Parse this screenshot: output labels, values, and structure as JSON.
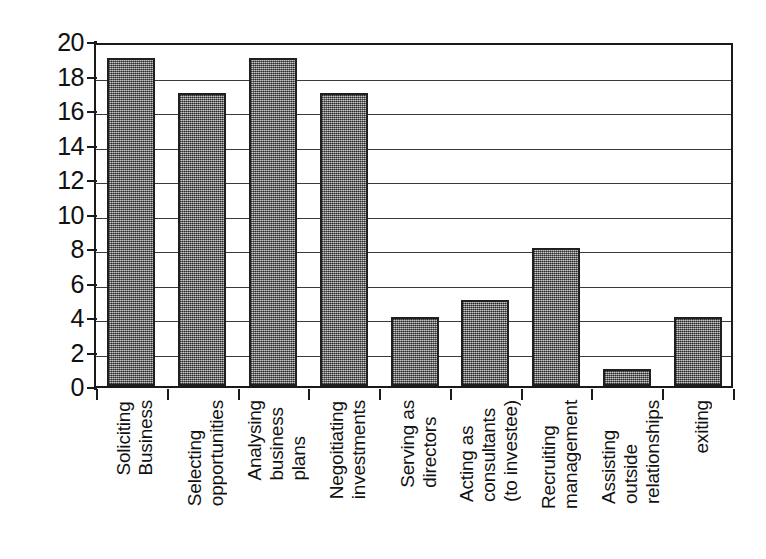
{
  "chart_data": {
    "type": "bar",
    "title": "",
    "subtitle": "",
    "xlabel": "",
    "ylabel": "",
    "ylim": [
      0,
      20
    ],
    "ytick_step": 2,
    "yticks": [
      20,
      18,
      16,
      14,
      12,
      10,
      8,
      6,
      4,
      2,
      0
    ],
    "grid": true,
    "legend": false,
    "legend_position": "none",
    "orientation": "vertical",
    "xtick_label_rotation": 90,
    "categories": [
      "Soliciting Business",
      "Selecting opportunities",
      "Analysing business plans",
      "Negoitiating investments",
      "Serving as directors",
      "Acting as consultants (to investee)",
      "Recruiting management",
      "Assisting outside relationships",
      "exiting"
    ],
    "category_label_lines": [
      [
        "Soliciting",
        "Business"
      ],
      [
        "Selecting",
        "opportunities"
      ],
      [
        "Analysing",
        "business",
        "plans"
      ],
      [
        "Negoitiating",
        "investments"
      ],
      [
        "Serving as",
        "directors"
      ],
      [
        "Acting as",
        "consultants",
        "(to investee)"
      ],
      [
        "Recruiting",
        "management"
      ],
      [
        "Assisting",
        "outside",
        "relationships"
      ],
      [
        "exiting"
      ]
    ],
    "values": [
      19,
      17,
      19,
      17,
      4,
      5,
      8,
      1,
      4
    ],
    "series": [
      {
        "name": "",
        "values": [
          19,
          17,
          19,
          17,
          4,
          5,
          8,
          1,
          4
        ]
      }
    ]
  },
  "style": {
    "bar_fill": "#8a8a8a",
    "bar_border": "#1f1f1f",
    "axis_color": "#1a1a1a",
    "gridline_color": "#3a3a3a",
    "text_color": "#111111",
    "background": "#ffffff"
  }
}
